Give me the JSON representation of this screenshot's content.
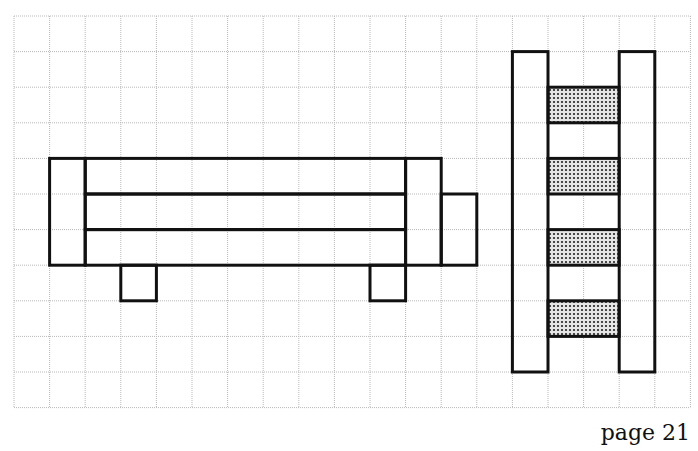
{
  "grid": {
    "x0": 14,
    "y0": 16,
    "cell": 35.6,
    "cols": 19,
    "rows": 11,
    "line_color": "#b8b8b8"
  },
  "outline_color": "#111111",
  "shade_color": "#8c8c8c",
  "shapes": {
    "bench": {
      "rects": [
        {
          "name": "bench-left-end",
          "c": 1,
          "r": 4,
          "w": 1,
          "h": 3
        },
        {
          "name": "bench-top-plank",
          "c": 2,
          "r": 4,
          "w": 9,
          "h": 1
        },
        {
          "name": "bench-middle-plank",
          "c": 2,
          "r": 5,
          "w": 9,
          "h": 1
        },
        {
          "name": "bench-bottom-plank",
          "c": 2,
          "r": 6,
          "w": 9,
          "h": 1
        },
        {
          "name": "bench-right-end",
          "c": 11,
          "r": 4,
          "w": 1,
          "h": 3
        },
        {
          "name": "bench-right-extension",
          "c": 12,
          "r": 5,
          "w": 1,
          "h": 2
        },
        {
          "name": "bench-leg-left",
          "c": 3,
          "r": 7,
          "w": 1,
          "h": 1
        },
        {
          "name": "bench-leg-right",
          "c": 10,
          "r": 7,
          "w": 1,
          "h": 1
        }
      ]
    },
    "ladder": {
      "rails": [
        {
          "name": "ladder-left-rail",
          "c": 14,
          "r": 1,
          "w": 1,
          "h": 9
        },
        {
          "name": "ladder-right-rail",
          "c": 17,
          "r": 1,
          "w": 1,
          "h": 9
        }
      ],
      "rungs": [
        {
          "name": "ladder-rung-1",
          "c": 15,
          "r": 2,
          "w": 2,
          "h": 1
        },
        {
          "name": "ladder-rung-2",
          "c": 15,
          "r": 4,
          "w": 2,
          "h": 1
        },
        {
          "name": "ladder-rung-3",
          "c": 15,
          "r": 6,
          "w": 2,
          "h": 1
        },
        {
          "name": "ladder-rung-4",
          "c": 15,
          "r": 8,
          "w": 2,
          "h": 1
        }
      ]
    }
  },
  "footer": {
    "page_label": "page 21"
  }
}
